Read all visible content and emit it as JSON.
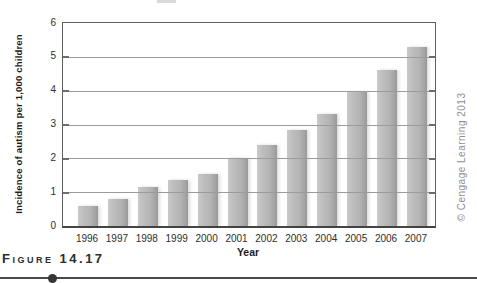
{
  "figure": {
    "label": "Figure 14.17",
    "credit": "© Cengage Learning 2013"
  },
  "chart_data": {
    "type": "bar",
    "title": "",
    "xlabel": "Year",
    "ylabel": "Incidence of autism per 1,000 children",
    "categories": [
      "1996",
      "1997",
      "1998",
      "1999",
      "2000",
      "2001",
      "2002",
      "2003",
      "2004",
      "2005",
      "2006",
      "2007"
    ],
    "values": [
      0.6,
      0.8,
      1.15,
      1.35,
      1.55,
      2.0,
      2.4,
      2.85,
      3.3,
      3.95,
      4.6,
      5.3
    ],
    "ylim": [
      0,
      6
    ],
    "yticks": [
      0,
      1,
      2,
      3,
      4,
      5,
      6
    ],
    "grid": true,
    "legend": false,
    "bar_color": "#b4b4b4",
    "gridline_color": "#9b9b9b",
    "frame_color": "#5f5f5f"
  }
}
